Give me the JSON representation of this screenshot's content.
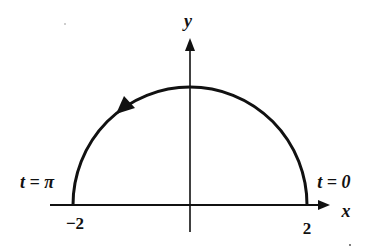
{
  "figure": {
    "axes": {
      "x_label": "x",
      "y_label": "y"
    },
    "ticks": {
      "left": "−2",
      "right": "2"
    },
    "annotations": {
      "start": "t = 0",
      "end": "t = π"
    },
    "curve": {
      "shape": "upper semicircle",
      "radius": 2,
      "direction": "counterclockwise",
      "arrow_icon": "arrowhead"
    },
    "colors": {
      "stroke": "#111111",
      "background": "#ffffff"
    }
  }
}
